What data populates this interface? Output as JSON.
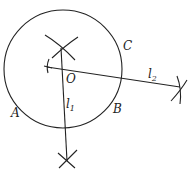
{
  "diagram": {
    "title": "",
    "circle": {
      "cx": 63,
      "cy": 69,
      "r": 59,
      "stroke": "#222222"
    },
    "lines": {
      "l1": {
        "x1": 61,
        "y1": 48,
        "x2": 67,
        "y2": 161
      },
      "l2": {
        "x1": 47,
        "y1": 67,
        "x2": 180,
        "y2": 87
      }
    },
    "labels": {
      "O": "O",
      "A": "A",
      "B": "B",
      "C": "C",
      "l1_main": "l",
      "l1_sub": "1",
      "l2_main": "l",
      "l2_sub": "2"
    }
  }
}
